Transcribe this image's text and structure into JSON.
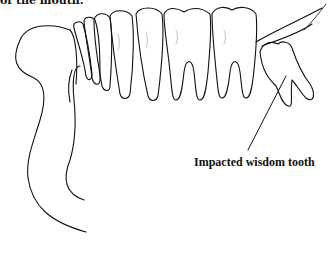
{
  "figure": {
    "caption_fragment": "of the mouth.",
    "labels": [
      {
        "id": "impacted-wisdom-tooth",
        "text": "Impacted wisdom tooth"
      }
    ],
    "colors": {
      "stroke": "#111111",
      "background": "#ffffff"
    }
  }
}
